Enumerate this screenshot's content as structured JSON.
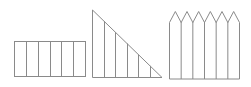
{
  "diagram": {
    "stroke_color": "#8a8a8a",
    "background": "#ffffff",
    "shapes": [
      {
        "name": "rectangle",
        "strips": 6,
        "x0": 14,
        "x1": 85,
        "y_top": 41,
        "y_bottom": 76
      },
      {
        "name": "right-triangle",
        "strips": 6,
        "x0": 92,
        "x1": 161,
        "y_top": 10,
        "y_bottom": 77
      },
      {
        "name": "picket-fence",
        "strips": 6,
        "x0": 169,
        "x1": 239,
        "y_shoulder": 22,
        "y_peak": 11,
        "y_bottom": 78
      }
    ]
  }
}
